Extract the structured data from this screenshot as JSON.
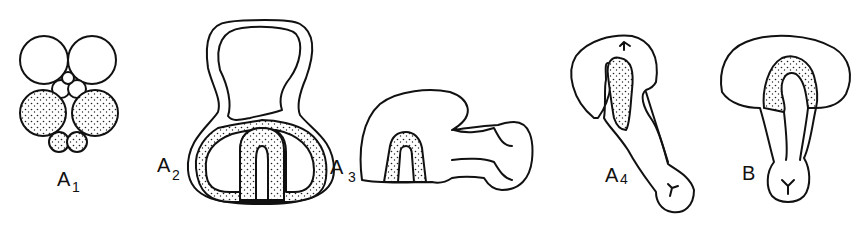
{
  "figure": {
    "panels": [
      {
        "id": "A1",
        "letter": "A",
        "subscript": "1"
      },
      {
        "id": "A2",
        "letter": "A",
        "subscript": "2"
      },
      {
        "id": "A3",
        "letter": "A",
        "subscript": "3"
      },
      {
        "id": "A4",
        "letter": "A",
        "subscript": "4"
      },
      {
        "id": "B",
        "letter": "B",
        "subscript": ""
      }
    ],
    "colors": {
      "ink": "#111111",
      "background": "#ffffff"
    }
  }
}
